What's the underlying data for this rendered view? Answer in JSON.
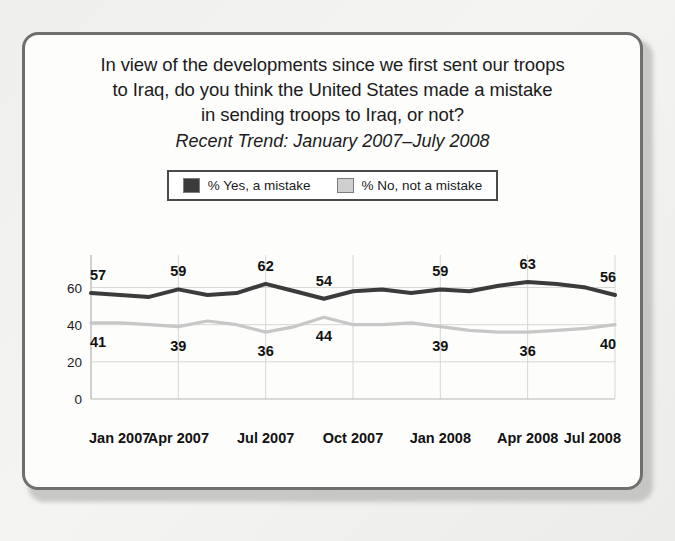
{
  "card": {
    "title_lines": [
      "In view of the developments since we first sent our troops",
      "to Iraq, do you think the United States made a mistake",
      "in sending troops to Iraq, or not?"
    ],
    "subtitle": "Recent Trend: January 2007–July 2008"
  },
  "legend": {
    "items": [
      {
        "label": "% Yes, a mistake",
        "color": "#3b3b3b"
      },
      {
        "label": "% No, not a mistake",
        "color": "#cfcfcf"
      }
    ]
  },
  "colors": {
    "yes_line": "#3b3b3b",
    "no_line": "#c7c7c7",
    "grid": "#d6d6d4",
    "axis": "#b6b6b4",
    "card_border": "#6f6f6f",
    "card_background": "#fdfdfc",
    "page_background": "#f2f2f0",
    "text": "#1b1b1b"
  },
  "chart_data": {
    "type": "line",
    "title": "In view of the developments since we first sent our troops to Iraq, do you think the United States made a mistake in sending troops to Iraq, or not?",
    "subtitle": "Recent Trend: January 2007–July 2008",
    "xlabel": "",
    "ylabel": "",
    "ylim": [
      0,
      70
    ],
    "yticks": [
      0,
      20,
      40,
      60
    ],
    "grid": true,
    "legend_position": "top-center",
    "xticks": [
      "Jan 2007",
      "Apr 2007",
      "Jul 2007",
      "Oct 2007",
      "Jan 2008",
      "Apr 2008",
      "Jul 2008"
    ],
    "x": [
      "Jan 2007",
      "Feb 2007",
      "Mar 2007",
      "Apr 2007",
      "May 2007",
      "Jun 2007",
      "Jul 2007",
      "Aug 2007",
      "Sep 2007",
      "Oct 2007",
      "Nov 2007",
      "Dec 2007",
      "Jan 2008",
      "Feb 2008",
      "Mar 2008",
      "Apr 2008",
      "May 2008",
      "Jun 2008",
      "Jul 2008"
    ],
    "series": [
      {
        "name": "% Yes, a mistake",
        "color": "#3b3b3b",
        "values": [
          57,
          56,
          55,
          59,
          56,
          57,
          62,
          58,
          54,
          58,
          59,
          57,
          59,
          58,
          61,
          63,
          62,
          60,
          56
        ],
        "labeled_points": [
          {
            "x": "Jan 2007",
            "value": 57
          },
          {
            "x": "Apr 2007",
            "value": 59
          },
          {
            "x": "Jul 2007",
            "value": 62
          },
          {
            "x": "Sep 2007",
            "value": 54
          },
          {
            "x": "Jan 2008",
            "value": 59
          },
          {
            "x": "Apr 2008",
            "value": 63
          },
          {
            "x": "Jul 2008",
            "value": 56
          }
        ]
      },
      {
        "name": "% No, not a mistake",
        "color": "#c7c7c7",
        "values": [
          41,
          41,
          40,
          39,
          42,
          40,
          36,
          39,
          44,
          40,
          40,
          41,
          39,
          37,
          36,
          36,
          37,
          38,
          40
        ],
        "labeled_points": [
          {
            "x": "Jan 2007",
            "value": 41
          },
          {
            "x": "Apr 2007",
            "value": 39
          },
          {
            "x": "Jul 2007",
            "value": 36
          },
          {
            "x": "Sep 2007",
            "value": 44
          },
          {
            "x": "Jan 2008",
            "value": 39
          },
          {
            "x": "Apr 2008",
            "value": 36
          },
          {
            "x": "Jul 2008",
            "value": 40
          }
        ]
      }
    ]
  }
}
